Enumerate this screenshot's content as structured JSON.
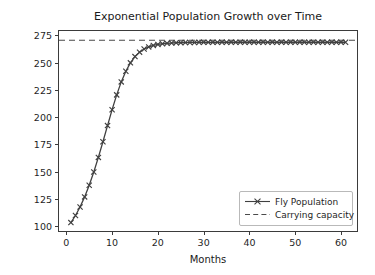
{
  "chart_data": {
    "type": "line",
    "title": "Exponential Population Growth over Time",
    "xlabel": "Months",
    "ylabel": "Fly Population",
    "xlim": [
      -1.6,
      63.5
    ],
    "ylim": [
      95.5,
      279.0
    ],
    "xticks": [
      0,
      10,
      20,
      30,
      40,
      50,
      60
    ],
    "yticks": [
      100,
      125,
      150,
      175,
      200,
      225,
      250,
      275
    ],
    "grid": false,
    "legend_position": "lower right",
    "series": [
      {
        "name": "Fly Population",
        "type": "line",
        "marker": "x",
        "linestyle": "solid",
        "color": "#404040",
        "x": [
          1,
          2,
          3,
          4,
          5,
          6,
          7,
          8,
          9,
          10,
          11,
          12,
          13,
          14,
          15,
          16,
          17,
          18,
          19,
          20,
          21,
          22,
          23,
          24,
          25,
          26,
          27,
          28,
          29,
          30,
          31,
          32,
          33,
          34,
          35,
          36,
          37,
          38,
          39,
          40,
          41,
          42,
          43,
          44,
          45,
          46,
          47,
          48,
          49,
          50,
          51,
          52,
          53,
          54,
          55,
          56,
          57,
          58,
          59,
          60,
          61
        ],
        "values": [
          103.2,
          109.7,
          117.5,
          126.8,
          137.5,
          149.6,
          163.0,
          177.4,
          192.2,
          206.8,
          220.4,
          232.3,
          242.1,
          249.8,
          255.5,
          259.6,
          262.5,
          264.4,
          265.8,
          266.7,
          267.3,
          267.7,
          268.0,
          268.2,
          268.3,
          268.4,
          268.5,
          268.5,
          268.6,
          268.6,
          268.6,
          268.6,
          268.6,
          268.7,
          268.7,
          268.7,
          268.7,
          268.7,
          268.7,
          268.7,
          268.7,
          268.7,
          268.7,
          268.7,
          268.7,
          268.7,
          268.7,
          268.7,
          268.7,
          268.7,
          268.7,
          268.7,
          268.7,
          268.7,
          268.7,
          268.7,
          268.7,
          268.7,
          268.7,
          268.7,
          268.7
        ]
      },
      {
        "name": "Carrying capacity",
        "type": "hline",
        "marker": "none",
        "linestyle": "dashed",
        "color": "#4a4a4a",
        "value": 270.5
      }
    ]
  },
  "legend": {
    "entries": [
      {
        "label": "Fly Population"
      },
      {
        "label": "Carrying capacity"
      }
    ]
  },
  "colors": {
    "line": "#404040",
    "capacity": "#4a4a4a",
    "spine": "#3b3b3b",
    "text": "#1f1f1f",
    "background": "#ffffff"
  }
}
